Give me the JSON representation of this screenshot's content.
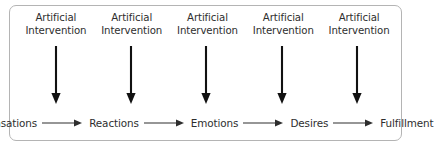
{
  "diagram": {
    "type": "flow-diagram",
    "background_color": "#ffffff",
    "border_color": "#b4b4b4",
    "text_color": "#2e2e2e",
    "arrow_color": "#111111",
    "top_labels": [
      {
        "line1": "Artificial",
        "line2": "Intervention"
      },
      {
        "line1": "Artificial",
        "line2": "Intervention"
      },
      {
        "line1": "Artificial",
        "line2": "Intervention"
      },
      {
        "line1": "Artificial",
        "line2": "Intervention"
      },
      {
        "line1": "Artificial",
        "line2": "Intervention"
      }
    ],
    "vertical_arrows": [
      {
        "name": "down-arrow-1"
      },
      {
        "name": "down-arrow-2"
      },
      {
        "name": "down-arrow-3"
      },
      {
        "name": "down-arrow-4"
      },
      {
        "name": "down-arrow-5"
      }
    ],
    "chain_labels": [
      "Sensations",
      "Reactions",
      "Emotions",
      "Desires",
      "Fulfillment"
    ],
    "chain_connectors": [
      "right-arrow-1",
      "right-arrow-2",
      "right-arrow-3",
      "right-arrow-4"
    ]
  }
}
